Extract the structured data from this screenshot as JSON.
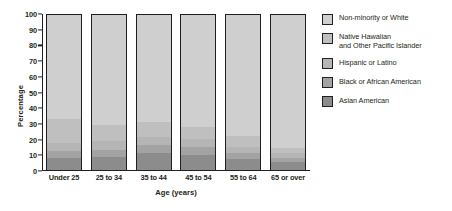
{
  "chart_data": {
    "type": "bar",
    "subtype": "stacked-bar-100-percent",
    "title": "",
    "xlabel": "Age (years)",
    "ylabel": "Percentage",
    "ylim": [
      0,
      100
    ],
    "yticks": [
      0,
      10,
      20,
      30,
      40,
      50,
      60,
      70,
      80,
      90,
      100
    ],
    "grid": false,
    "legend_position": "right",
    "categories": [
      "Under 25",
      "25 to 34",
      "35 to 44",
      "45 to 54",
      "55 to 64",
      "65 or over"
    ],
    "series": [
      {
        "name": "Asian American",
        "color": "#8c8c8c",
        "values": [
          7.5,
          8.5,
          11.0,
          10.0,
          7.0,
          5.0
        ]
      },
      {
        "name": "Black or African American",
        "color": "#a3a3a3",
        "values": [
          4.5,
          4.5,
          5.0,
          5.0,
          4.0,
          3.0
        ]
      },
      {
        "name": "Hispanic or Latino",
        "color": "#b5b5b5",
        "values": [
          5.5,
          6.0,
          5.0,
          5.0,
          4.0,
          3.0
        ]
      },
      {
        "name": "Native Hawaiian and Other Pacific Islander",
        "color": "#bfbfbf",
        "values": [
          15.5,
          10.0,
          10.0,
          8.0,
          7.0,
          3.0
        ]
      },
      {
        "name": "Non-minority or White",
        "color": "#cfcfcf",
        "values": [
          67.0,
          71.0,
          69.0,
          72.0,
          78.0,
          86.0
        ]
      }
    ]
  },
  "legend": {
    "items": [
      {
        "label_line1": "Non-minority or White",
        "label_line2": "",
        "color": "#cfcfcf",
        "icon": "legend-swatch-icon"
      },
      {
        "label_line1": "Native Hawaiian",
        "label_line2": "and Other Pacific Islander",
        "color": "#bfbfbf",
        "icon": "legend-swatch-icon"
      },
      {
        "label_line1": "Hispanic or Latino",
        "label_line2": "",
        "color": "#b5b5b5",
        "icon": "legend-swatch-icon"
      },
      {
        "label_line1": "Black or African American",
        "label_line2": "",
        "color": "#a3a3a3",
        "icon": "legend-swatch-icon"
      },
      {
        "label_line1": "Asian American",
        "label_line2": "",
        "color": "#8c8c8c",
        "icon": "legend-swatch-icon"
      }
    ]
  },
  "axes": {
    "y_title": "Percentage",
    "x_title": "Age (years)",
    "y_tick_labels": [
      "0",
      "10",
      "20",
      "30",
      "40",
      "50",
      "60",
      "70",
      "80",
      "90",
      "100"
    ],
    "x_tick_labels": [
      "Under 25",
      "25 to 34",
      "35 to 44",
      "45 to 54",
      "55 to 64",
      "65 or over"
    ]
  },
  "style": {
    "axis_color": "#231f20",
    "background": "#ffffff"
  }
}
